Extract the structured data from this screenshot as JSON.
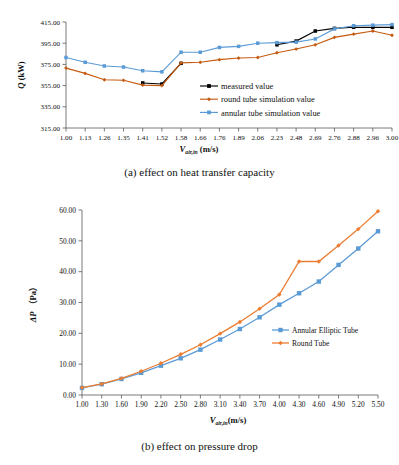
{
  "figure": {
    "panels": [
      {
        "id": "a",
        "caption": "(a) effect on heat transfer capacity"
      },
      {
        "id": "b",
        "caption": "(b) effect on pressure drop"
      }
    ]
  },
  "chart_data": [
    {
      "type": "line",
      "title": "(a) effect on heat transfer capacity",
      "xlabel": "V_air,in (m/s)",
      "xlabel_main": "V",
      "xlabel_sub": "air,in",
      "xlabel_unit": "(m/s)",
      "ylabel": "Q (kW)",
      "ylabel_main": "Q",
      "ylabel_unit": "(kW)",
      "categories": [
        "1.00",
        "1.13",
        "1.26",
        "1.35",
        "1.41",
        "1.52",
        "1.58",
        "1.66",
        "1.76",
        "1.89",
        "2.06",
        "2.23",
        "2.48",
        "2.69",
        "2.76",
        "2.88",
        "2.96",
        "3.00"
      ],
      "ylim": [
        315.0,
        415.0
      ],
      "yticks": [
        "315.00",
        "335.00",
        "355.00",
        "375.00",
        "395.00",
        "415.00"
      ],
      "grid": false,
      "legend_position": "inside-right-lower",
      "series": [
        {
          "name": "measured value",
          "color": "#000000",
          "marker": "square",
          "values": [
            null,
            null,
            null,
            null,
            357.5,
            356.5,
            376.0,
            null,
            null,
            null,
            null,
            393.5,
            397.0,
            406.5,
            409.0,
            410.0,
            410.0,
            410.0
          ]
        },
        {
          "name": "round tube simulation value",
          "color": "#C55A11",
          "marker": "diamond",
          "values": [
            371.5,
            366.5,
            360.5,
            360.0,
            355.5,
            355.0,
            376.5,
            377.0,
            379.5,
            381.0,
            381.5,
            386.0,
            389.5,
            393.5,
            400.5,
            403.5,
            406.5,
            402.5
          ]
        },
        {
          "name": "annular tube simulation value",
          "color": "#5B9BD5",
          "marker": "square",
          "values": [
            381.5,
            377.0,
            373.5,
            372.5,
            369.0,
            368.0,
            386.5,
            386.5,
            391.0,
            392.0,
            395.0,
            395.5,
            396.0,
            399.0,
            408.5,
            411.5,
            412.0,
            412.5
          ]
        }
      ]
    },
    {
      "type": "line",
      "title": "(b) effect on pressure drop",
      "xlabel": "V_air,in(m/s)",
      "xlabel_main": "V",
      "xlabel_sub": "air,in",
      "xlabel_unit": "(m/s)",
      "ylabel": "ΔP (Pa)",
      "ylabel_main": "ΔP",
      "ylabel_unit": "（Pa）",
      "categories": [
        "1.00",
        "1.30",
        "1.60",
        "1.90",
        "2.20",
        "2.50",
        "2.80",
        "3.10",
        "3.40",
        "3.70",
        "4.00",
        "4.30",
        "4.60",
        "4.90",
        "5.20",
        "5.50"
      ],
      "ylim": [
        0.0,
        60.0
      ],
      "yticks": [
        "0.00",
        "10.00",
        "20.00",
        "30.00",
        "40.00",
        "50.00",
        "60.00"
      ],
      "grid": false,
      "legend_position": "inside-right",
      "series": [
        {
          "name": "Annular Elliptic Tube",
          "color": "#5B9BD5",
          "marker": "square",
          "values": [
            2.3,
            3.5,
            5.2,
            7.2,
            9.5,
            11.9,
            14.7,
            18.0,
            21.4,
            25.2,
            29.3,
            33.0,
            36.8,
            42.2,
            47.5,
            53.1
          ]
        },
        {
          "name": "Round Tube",
          "color": "#ED7D31",
          "marker": "diamond",
          "values": [
            2.4,
            3.6,
            5.4,
            7.7,
            10.3,
            13.2,
            16.3,
            19.9,
            23.7,
            28.0,
            32.6,
            43.3,
            43.3,
            48.5,
            53.8,
            59.6
          ]
        }
      ]
    }
  ]
}
